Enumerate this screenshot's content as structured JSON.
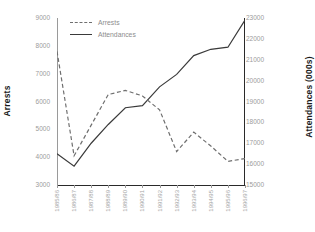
{
  "chart_data": {
    "type": "line",
    "title": "",
    "subtitle": "",
    "xlabel": "",
    "ylabel": "Arrests",
    "y2label": "Attendances (000s)",
    "grid": false,
    "legend_position": "top-left",
    "categories": [
      "1985/86",
      "1986/87",
      "1987/88",
      "1988/89",
      "1989/90",
      "1990/91",
      "1991/92",
      "1992/93",
      "1993/94",
      "1994/95",
      "1995/96",
      "1996/97"
    ],
    "ylim": [
      3000,
      9000
    ],
    "yticks": [
      3000,
      4000,
      5000,
      6000,
      7000,
      8000,
      9000
    ],
    "y2lim": [
      15000,
      23000
    ],
    "y2ticks": [
      15000,
      16000,
      17000,
      18000,
      19000,
      20000,
      21000,
      22000,
      23000
    ],
    "series": [
      {
        "name": "Arrests",
        "axis": "left",
        "style": "dashed",
        "color": "#6f6f6f",
        "values": [
          7800,
          4050,
          5150,
          6250,
          6400,
          6200,
          5700,
          4200,
          4900,
          4400,
          3850,
          3950
        ]
      },
      {
        "name": "Attendances",
        "axis": "right",
        "style": "solid",
        "color": "#3a3a3a",
        "values": [
          16500,
          15900,
          17000,
          17900,
          18700,
          18800,
          19700,
          20300,
          21200,
          21500,
          21600,
          22900
        ]
      }
    ]
  },
  "legend": {
    "arrests_label": "Arrests",
    "attendances_label": "Attendances"
  },
  "axes": {
    "left_title": "Arrests",
    "right_title": "Attendances (000s)"
  }
}
